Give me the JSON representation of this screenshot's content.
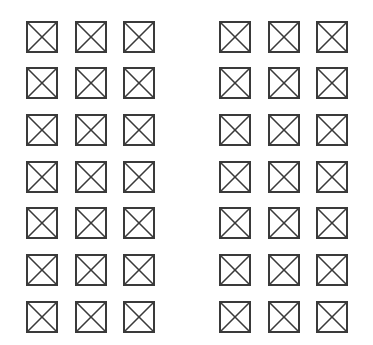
{
  "figure": {
    "stroke_color": "#3a3a3a",
    "fill_color": "#ffffff",
    "box_size": 32,
    "rows_y": [
      21,
      67,
      114,
      161,
      207,
      254,
      301
    ],
    "groups": [
      {
        "name": "left-group",
        "columns_x": [
          26,
          75,
          123
        ]
      },
      {
        "name": "right-group",
        "columns_x": [
          219,
          268,
          316
        ]
      }
    ],
    "rows": 7,
    "columns_per_group": 3,
    "total_boxes": 42
  }
}
